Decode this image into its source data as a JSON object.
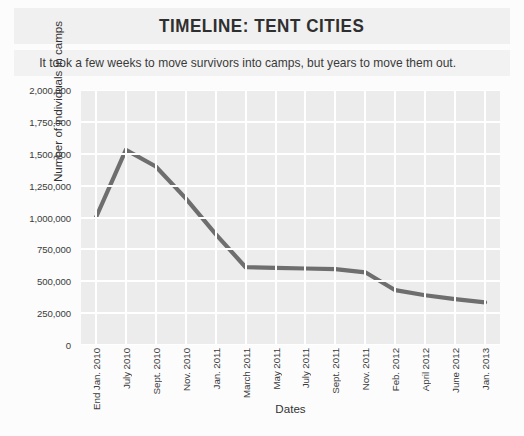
{
  "chart_data": {
    "type": "line",
    "title": "TIMELINE: TENT CITIES",
    "subtitle": "It took a few weeks to move survivors into camps, but years to move them out.",
    "xlabel": "Dates",
    "ylabel": "Number of individuals in camps",
    "ylim": [
      0,
      2000000
    ],
    "yticks": [
      2000000,
      1750000,
      1500000,
      1250000,
      1000000,
      750000,
      500000,
      250000,
      0
    ],
    "ytick_labels": [
      "2,000,000",
      "1,750,000",
      "1,500,000",
      "1,250,000",
      "1,000,000",
      "750,000",
      "500,000",
      "250,000",
      "0"
    ],
    "grid": true,
    "legend": "none",
    "categories": [
      "End Jan. 2010",
      "July 2010",
      "Sept. 2010",
      "Nov. 2010",
      "Jan. 2011",
      "March 2011",
      "May 2011",
      "July 2011",
      "Sept. 2011",
      "Nov. 2011",
      "Feb. 2012",
      "April 2012",
      "June 2012",
      "Jan. 2013"
    ],
    "values": [
      1000000,
      1530000,
      1400000,
      1150000,
      870000,
      610000,
      605000,
      600000,
      595000,
      570000,
      430000,
      390000,
      360000,
      335000
    ],
    "line_color": "#6e6e6e",
    "plot_background": "#ececec",
    "gridline_color": "#ffffff",
    "panel_background": "#f0f0f0"
  }
}
